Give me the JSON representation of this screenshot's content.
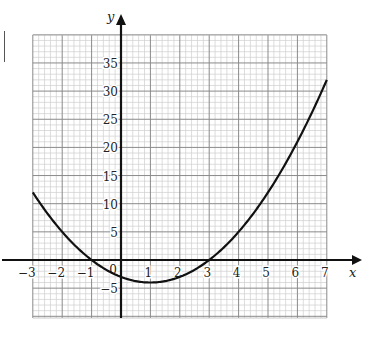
{
  "chart_data": {
    "type": "line",
    "title": "",
    "xlabel": "x",
    "ylabel": "y",
    "xlim": [
      -3,
      7
    ],
    "ylim": [
      -10,
      40
    ],
    "grid": true,
    "legend": null,
    "x_ticks": [
      -3,
      -2,
      -1,
      0,
      1,
      2,
      3,
      4,
      5,
      6,
      7
    ],
    "x_tick_labels": [
      "−3",
      "−2",
      "−1",
      "0",
      "1",
      "2",
      "3",
      "4",
      "5",
      "6",
      "7"
    ],
    "y_ticks": [
      -5,
      5,
      10,
      15,
      20,
      25,
      30,
      35
    ],
    "y_tick_labels": [
      "−5",
      "5",
      "10",
      "15",
      "20",
      "25",
      "30",
      "35"
    ],
    "series": [
      {
        "name": "y = x^2 - 2x - 3",
        "x": [
          -3,
          -2,
          -1,
          0,
          1,
          2,
          3,
          4,
          5,
          6,
          7
        ],
        "y": [
          12,
          5,
          0,
          -3,
          -4,
          -3,
          0,
          5,
          12,
          21,
          32
        ]
      }
    ],
    "annotations": {
      "roots": [
        -1,
        3
      ],
      "minimum": [
        1,
        -4
      ],
      "y_intercept": -3
    }
  },
  "labels": {
    "x_axis": "x",
    "y_axis": "y"
  }
}
